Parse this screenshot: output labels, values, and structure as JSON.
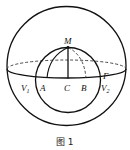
{
  "figure": {
    "caption": "图 1",
    "labels": {
      "M": "M",
      "A": "A",
      "C": "C",
      "B": "B",
      "V1": "V",
      "V1_sub": "1",
      "V2": "V",
      "V2_sub": "2",
      "Gamma": "Γ"
    },
    "colors": {
      "stroke": "#111111",
      "background": "#ffffff"
    }
  }
}
